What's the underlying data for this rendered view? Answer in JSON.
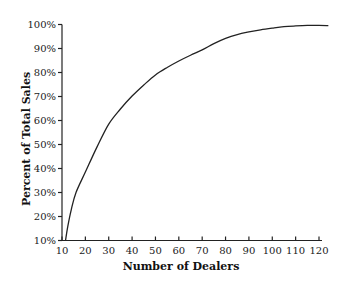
{
  "chart_data": {
    "type": "line",
    "title": "",
    "xlabel": "Number of Dealers",
    "ylabel": "Percent of Total Sales",
    "xlim": [
      10,
      120
    ],
    "ylim": [
      10,
      100
    ],
    "x_ticks": [
      10,
      20,
      30,
      40,
      50,
      60,
      70,
      80,
      90,
      100,
      110,
      120
    ],
    "x_tick_labels": [
      "10",
      "20",
      "30",
      "40",
      "50",
      "60",
      "70",
      "80",
      "90",
      "100",
      "110",
      "120"
    ],
    "y_ticks": [
      10,
      20,
      30,
      40,
      50,
      60,
      70,
      80,
      90,
      100
    ],
    "y_tick_labels": [
      "10%",
      "20%",
      "30%",
      "40%",
      "50%",
      "60%",
      "70%",
      "80%",
      "90%",
      "100%"
    ],
    "grid": false,
    "legend": null,
    "series": [
      {
        "name": "Cumulative share of sales",
        "color": "#222222",
        "x": [
          11.5,
          12.5,
          14,
          16,
          20,
          25,
          30,
          35,
          40,
          45,
          50,
          55,
          60,
          65,
          70,
          75,
          80,
          85,
          90,
          95,
          100,
          105,
          110,
          115,
          120,
          124
        ],
        "y": [
          10,
          16,
          23,
          30,
          38.5,
          49,
          58.5,
          64.8,
          70.2,
          74.8,
          79,
          82.1,
          84.8,
          87.2,
          89.4,
          92,
          94.2,
          95.8,
          96.9,
          97.8,
          98.5,
          99.1,
          99.4,
          99.6,
          99.6,
          99.5
        ]
      }
    ]
  }
}
